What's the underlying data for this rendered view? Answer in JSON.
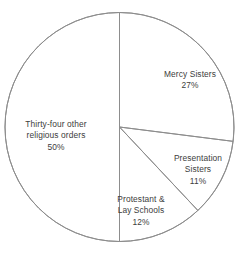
{
  "chart_data": {
    "type": "pie",
    "title": "",
    "subtitle": "",
    "xlabel": "",
    "ylabel": "",
    "legend": "none",
    "grid": false,
    "start_angle_deg": 0,
    "direction": "clockwise",
    "units": "percent",
    "total": 100,
    "categories": [
      "Mercy Sisters",
      "Presentation Sisters",
      "Protestant & Lay Schools",
      "Thirty-four other religious orders"
    ],
    "values": [
      27,
      11,
      12,
      50
    ],
    "slices": [
      {
        "name": "Mercy Sisters",
        "value": 27,
        "value_label": "27%",
        "label_lines": [
          "Mercy Sisters"
        ],
        "label_x": 190,
        "label_y": 80,
        "start_deg": 0,
        "end_deg": 97.2,
        "fill": "#ffffff",
        "stroke": "#8d8d8d"
      },
      {
        "name": "Presentation Sisters",
        "value": 11,
        "value_label": "11%",
        "label_lines": [
          "Presentation",
          "Sisters"
        ],
        "label_x": 198,
        "label_y": 170,
        "start_deg": 97.2,
        "end_deg": 136.8,
        "fill": "#ffffff",
        "stroke": "#8d8d8d"
      },
      {
        "name": "Protestant & Lay Schools",
        "value": 12,
        "value_label": "12%",
        "label_lines": [
          "Protestant &",
          "Lay Schools"
        ],
        "label_x": 141,
        "label_y": 211,
        "start_deg": 136.8,
        "end_deg": 180,
        "fill": "#ffffff",
        "stroke": "#8d8d8d"
      },
      {
        "name": "Thirty-four other religious orders",
        "value": 50,
        "value_label": "50%",
        "label_lines": [
          "Thirty-four other",
          "religious orders"
        ],
        "label_x": 56,
        "label_y": 136,
        "start_deg": 180,
        "end_deg": 360,
        "fill": "#ffffff",
        "stroke": "#8d8d8d"
      }
    ],
    "geometry": {
      "center_x": 119.5,
      "center_y": 127,
      "radius": 114.5
    },
    "colors": {
      "background": "#ffffff",
      "stroke": "#8d8d8d",
      "text": "#3d3d3d"
    }
  }
}
